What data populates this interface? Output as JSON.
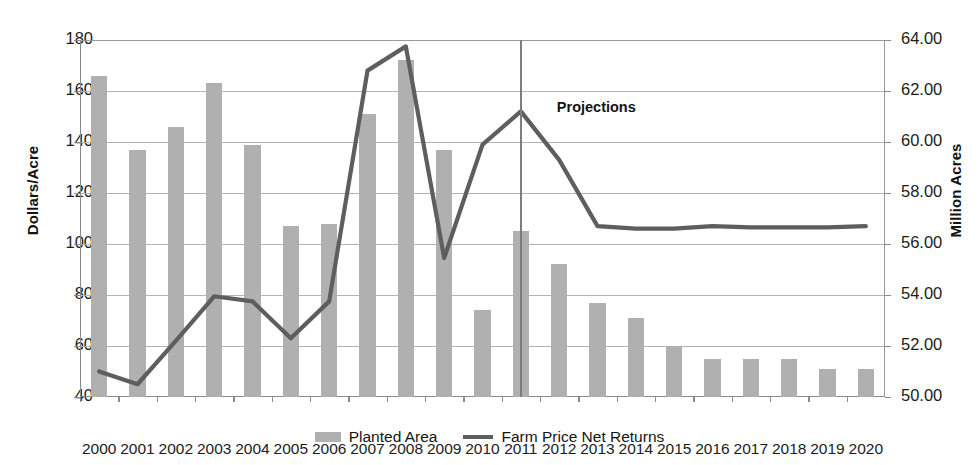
{
  "chart_data": {
    "type": "bar",
    "title": "",
    "xlabel": "",
    "ylabel": "Dollars/Acre",
    "y2label": "Million Acres",
    "ylim": [
      40,
      180
    ],
    "y2lim": [
      50.0,
      64.0
    ],
    "ytick_labels": [
      "180",
      "160",
      "140",
      "120",
      "100",
      "80",
      "60",
      "40"
    ],
    "ytick_values": [
      180,
      160,
      140,
      120,
      100,
      80,
      60,
      40
    ],
    "y2tick_labels": [
      "64.00",
      "62.00",
      "60.00",
      "58.00",
      "56.00",
      "54.00",
      "52.00",
      "50.00"
    ],
    "y2tick_values": [
      64.0,
      62.0,
      60.0,
      58.0,
      56.0,
      54.0,
      52.0,
      50.0
    ],
    "grid": true,
    "legend_position": "bottom",
    "categories": [
      "2000",
      "2001",
      "2002",
      "2003",
      "2004",
      "2005",
      "2006",
      "2007",
      "2008",
      "2009",
      "2010",
      "2011",
      "2012",
      "2013",
      "2014",
      "2015",
      "2016",
      "2017",
      "2018",
      "2019",
      "2020"
    ],
    "series": [
      {
        "name": "Planted Area",
        "kind": "bar",
        "axis": "right",
        "unit": "Million Acres",
        "color": "#b0b0b0",
        "values": [
          62.6,
          59.7,
          60.6,
          62.3,
          59.9,
          56.7,
          56.8,
          61.1,
          63.2,
          59.7,
          53.4,
          56.5,
          55.2,
          53.7,
          53.1,
          52.0,
          51.5,
          51.5,
          51.5,
          51.1,
          51.1
        ]
      },
      {
        "name": "Farm Price Net Returns",
        "kind": "line",
        "axis": "left",
        "unit": "Dollars/Acre",
        "color": "#5e5e5e",
        "values": [
          50,
          45,
          62,
          79.5,
          77.5,
          63,
          77.5,
          168,
          177.5,
          94.5,
          139,
          152,
          133,
          107,
          106,
          106,
          107,
          106.5,
          106.5,
          106.5,
          107
        ]
      }
    ],
    "annotations": [
      {
        "name": "projections-divider",
        "label": "Projections",
        "at_category": "2011",
        "type": "vertical-line-with-label"
      }
    ]
  },
  "legend": {
    "items": [
      {
        "label": "Planted Area",
        "marker": "bar-swatch"
      },
      {
        "label": "Farm Price Net Returns",
        "marker": "line-swatch"
      }
    ]
  },
  "axes": {
    "left_title": "Dollars/Acre",
    "right_title": "Million Acres"
  },
  "colors": {
    "bar": "#b0b0b0",
    "line": "#5e5e5e",
    "grid": "#b3b3b3",
    "axis": "#8a8a8a",
    "text": "#1c1c1c"
  }
}
